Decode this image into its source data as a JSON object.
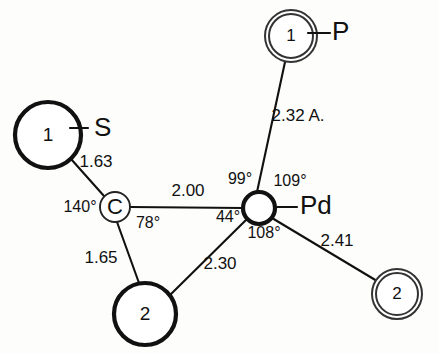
{
  "figure": {
    "type": "molecular-structure-diagram",
    "units_note": "2.32 A.",
    "background_color": "#fdfdfb",
    "line_color": "#111111"
  },
  "atoms": [
    {
      "id": "s-atom",
      "inner_text": "1",
      "element_label": "S",
      "circle_style": "thick-single",
      "cx": 48,
      "cy": 135,
      "r": 33,
      "label_x": 94,
      "label_y": 129,
      "tick_from_x": 70,
      "tick_from_y": 128,
      "tick_to_x": 88,
      "tick_to_y": 128
    },
    {
      "id": "c-atom",
      "inner_text": "C",
      "element_label": "",
      "circle_style": "thin-single",
      "cx": 115,
      "cy": 207,
      "r": 15,
      "label_x": 0,
      "label_y": 0,
      "tick_from_x": 0,
      "tick_from_y": 0,
      "tick_to_x": 0,
      "tick_to_y": 0
    },
    {
      "id": "pd-atom",
      "inner_text": "",
      "element_label": "Pd",
      "circle_style": "thick-single",
      "cx": 259,
      "cy": 208,
      "r": 16,
      "label_x": 300,
      "label_y": 207,
      "tick_from_x": 275,
      "tick_from_y": 207,
      "tick_to_x": 297,
      "tick_to_y": 207
    },
    {
      "id": "p-atom",
      "inner_text": "1",
      "element_label": "P",
      "circle_style": "double",
      "cx": 291,
      "cy": 36,
      "r": 26,
      "label_x": 332,
      "label_y": 33,
      "tick_from_x": 308,
      "tick_from_y": 33,
      "tick_to_x": 330,
      "tick_to_y": 33
    },
    {
      "id": "c2-bottom-atom",
      "inner_text": "2",
      "element_label": "",
      "circle_style": "thick-single",
      "cx": 145,
      "cy": 314,
      "r": 31,
      "label_x": 0,
      "label_y": 0,
      "tick_from_x": 0,
      "tick_from_y": 0,
      "tick_to_x": 0,
      "tick_to_y": 0
    },
    {
      "id": "c2-right-atom",
      "inner_text": "2",
      "element_label": "",
      "circle_style": "double",
      "cx": 397,
      "cy": 294,
      "r": 25,
      "label_x": 0,
      "label_y": 0,
      "tick_from_x": 0,
      "tick_from_y": 0,
      "tick_to_x": 0,
      "tick_to_y": 0
    }
  ],
  "bonds": [
    {
      "id": "bond-s-c",
      "x1": 71,
      "y1": 159,
      "x2": 104,
      "y2": 196,
      "length_label": "1.63",
      "label_x": 96,
      "label_y": 163
    },
    {
      "id": "bond-c-pd",
      "x1": 130,
      "y1": 207,
      "x2": 243,
      "y2": 208,
      "length_label": "2.00",
      "label_x": 188,
      "label_y": 192
    },
    {
      "id": "bond-c-c2",
      "x1": 117,
      "y1": 222,
      "x2": 139,
      "y2": 283,
      "length_label": "1.65",
      "label_x": 101,
      "label_y": 259
    },
    {
      "id": "bond-c2-pd",
      "x1": 169,
      "y1": 296,
      "x2": 247,
      "y2": 219,
      "length_label": "2.30",
      "label_x": 220,
      "label_y": 265
    },
    {
      "id": "bond-pd-p",
      "x1": 257,
      "y1": 192,
      "x2": 285,
      "y2": 62,
      "length_label": "2.32 A.",
      "label_x": 298,
      "label_y": 117
    },
    {
      "id": "bond-pd-c2r",
      "x1": 272,
      "y1": 218,
      "x2": 377,
      "y2": 281,
      "length_label": "2.41",
      "label_x": 337,
      "label_y": 242
    }
  ],
  "angles": [
    {
      "id": "angle-c-140",
      "text": "140°",
      "x": 80,
      "y": 208
    },
    {
      "id": "angle-c-78",
      "text": "78°",
      "x": 148,
      "y": 224
    },
    {
      "id": "angle-pd-44",
      "text": "44°",
      "x": 228,
      "y": 218
    },
    {
      "id": "angle-pd-99",
      "text": "99°",
      "x": 240,
      "y": 180
    },
    {
      "id": "angle-pd-109",
      "text": "109°",
      "x": 290,
      "y": 182
    },
    {
      "id": "angle-pd-108",
      "text": "108°",
      "x": 264,
      "y": 234
    }
  ]
}
